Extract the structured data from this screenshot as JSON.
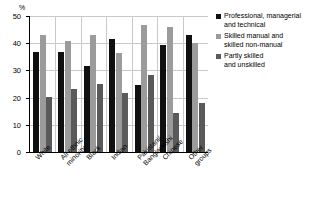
{
  "chart_data": {
    "type": "bar",
    "title": "",
    "xlabel": "",
    "ylabel": "%",
    "ylim": [
      0,
      50
    ],
    "yticks": [
      0,
      10,
      20,
      30,
      40,
      50
    ],
    "grid": true,
    "legend_position": "right",
    "categories": [
      "White",
      "All ethnic\nminority",
      "Black",
      "Indian",
      "Pakistani/\nBangladeshi",
      "Chinese",
      "Other\ngroups"
    ],
    "series": [
      {
        "name": "Professional, managerial\nand technical",
        "color": "#101010",
        "values": [
          36.8,
          36.6,
          31.6,
          41.6,
          24.5,
          39.5,
          43.0
        ]
      },
      {
        "name": "Skilled manual and\nskilled non-manual",
        "color": "#9b9b9b",
        "values": [
          43.0,
          40.8,
          43.1,
          36.5,
          46.6,
          45.9,
          40.0
        ]
      },
      {
        "name": "Partly skilled\nand unskilled",
        "color": "#5a5a5a",
        "values": [
          20.3,
          23.1,
          25.1,
          21.6,
          28.2,
          14.5,
          17.9
        ]
      }
    ]
  }
}
